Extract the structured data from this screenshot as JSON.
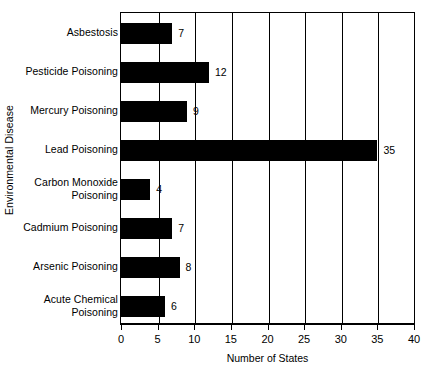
{
  "chart_data": {
    "type": "bar",
    "orientation": "horizontal",
    "title": "",
    "xlabel": "Number of States",
    "ylabel": "Environmental Disease",
    "categories": [
      "Asbestosis",
      "Pesticide Poisoning",
      "Mercury Poisoning",
      "Lead Poisoning",
      "Carbon Monoxide Poisoning",
      "Cadmium Poisoning",
      "Arsenic Poisoning",
      "Acute Chemical Poisoning"
    ],
    "values": [
      7,
      12,
      9,
      35,
      4,
      7,
      8,
      6
    ],
    "data_labels": [
      "7",
      "12",
      "9",
      "35",
      "4",
      "7",
      "8",
      "6"
    ],
    "xlim": [
      0,
      40
    ],
    "xticks": [
      0,
      5,
      10,
      15,
      20,
      25,
      30,
      35,
      40
    ],
    "xtick_labels": [
      "0",
      "5",
      "10",
      "15",
      "20",
      "25",
      "30",
      "35",
      "40"
    ],
    "grid": "vertical",
    "legend": null,
    "bar_color": "#000000",
    "background_color": "#FFFFFF",
    "axis_color": "#000000"
  },
  "axes": {
    "y_title": "Environmental Disease",
    "x_title": "Number of States"
  },
  "categories_wrapped": [
    [
      "Asbestosis"
    ],
    [
      "Pesticide Poisoning"
    ],
    [
      "Mercury Poisoning"
    ],
    [
      "Lead Poisoning"
    ],
    [
      "Carbon Monoxide",
      "Poisoning"
    ],
    [
      "Cadmium Poisoning"
    ],
    [
      "Arsenic Poisoning"
    ],
    [
      "Acute Chemical",
      "Poisoning"
    ]
  ]
}
